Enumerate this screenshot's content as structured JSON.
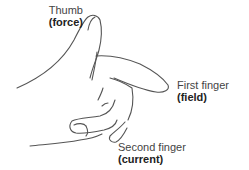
{
  "diagram": {
    "labels": [
      {
        "id": "thumb",
        "name": "Thumb",
        "role": "(force)"
      },
      {
        "id": "first",
        "name": "First finger",
        "role": "(field)"
      },
      {
        "id": "second",
        "name": "Second finger",
        "role": "(current)"
      }
    ],
    "colors": {
      "line": "#555555",
      "text": "#333333",
      "background": "#ffffff"
    }
  }
}
